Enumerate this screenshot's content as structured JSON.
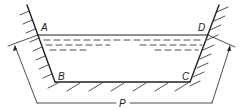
{
  "diagram": {
    "type": "open-channel-cross-section",
    "labels": {
      "A": "A",
      "B": "B",
      "C": "C",
      "D": "D",
      "P": "P"
    },
    "points": {
      "A": [
        38,
        35
      ],
      "B": [
        55,
        82
      ],
      "C": [
        190,
        82
      ],
      "D": [
        208,
        35
      ]
    },
    "colors": {
      "line": "#222222",
      "background": "#ffffff"
    }
  }
}
